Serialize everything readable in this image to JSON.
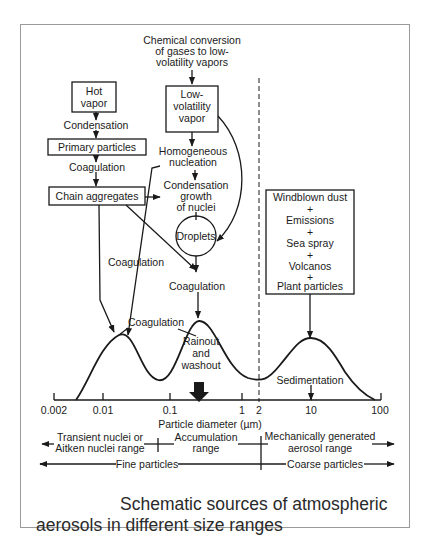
{
  "diagram": {
    "top_source": [
      "Chemical conversion",
      "of gases to low-",
      "volatility vapors"
    ],
    "boxes": {
      "hot_vapor": [
        "Hot",
        "vapor"
      ],
      "low_volatility_vapor": [
        "Low-",
        "volatility",
        "vapor"
      ],
      "primary_particles": "Primary particles",
      "chain_aggregates": "Chain aggregates",
      "coarse_sources": [
        "Windblown dust",
        "+",
        "Emissions",
        "+",
        "Sea spray",
        "+",
        "Volcanos",
        "+",
        "Plant particles"
      ]
    },
    "labels": {
      "condensation": "Condensation",
      "coagulation_1": "Coagulation",
      "homogeneous_nucleation": [
        "Homogeneous",
        "nucleation"
      ],
      "condensation_growth": [
        "Condensation",
        "growth",
        "of nuclei"
      ],
      "droplets": "Droplets",
      "coagulation_left": "Coagulation",
      "coagulation_center": "Coagulation",
      "coagulation_peak": "Coagulation",
      "rainout": [
        "Rainout",
        "and",
        "washout"
      ],
      "sedimentation": "Sedimentation"
    },
    "axis": {
      "title": "Particle diameter  (µm)",
      "ticks": [
        "0.002",
        "0.01",
        "0.1",
        "1",
        "2",
        "10",
        "100"
      ]
    },
    "ranges": {
      "transient": [
        "Transient nuclei or",
        "Aitken nuclei range"
      ],
      "accumulation": [
        "Accumulation",
        "range"
      ],
      "mechanical": [
        "Mechanically generated",
        "aerosol range"
      ],
      "fine": "Fine particles",
      "coarse": "Coarse particles"
    }
  },
  "caption": "Schematic sources of atmospheric aerosols in different size ranges"
}
